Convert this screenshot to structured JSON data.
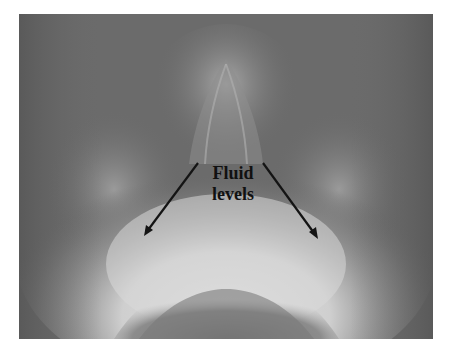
{
  "image": {
    "description": "Radiograph (occipitomental sinus view) with two arrows indicating fluid levels",
    "background_color": "#ffffff",
    "film_base_color": "#6a6a6a",
    "annotation": {
      "line1": "Fluid",
      "line2": "levels",
      "color": "#111111"
    },
    "arrows": [
      {
        "name": "left-arrow",
        "from": [
          198,
          163
        ],
        "to": [
          144,
          236
        ]
      },
      {
        "name": "right-arrow",
        "from": [
          263,
          163
        ],
        "to": [
          318,
          239
        ]
      }
    ]
  }
}
